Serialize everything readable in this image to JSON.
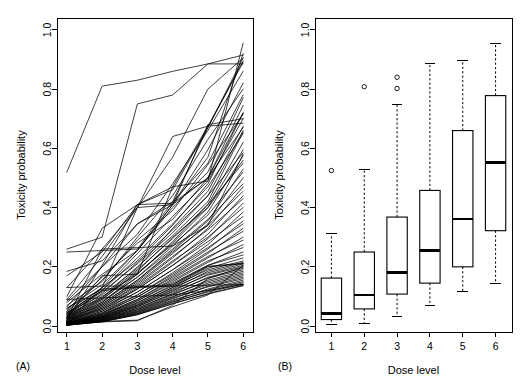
{
  "figure": {
    "background": "#ffffff",
    "ink": "#000000",
    "width": 524,
    "height": 388
  },
  "panels": [
    {
      "id": "A",
      "tag": "(A)",
      "type": "line",
      "title": "",
      "xlabel": "Dose level",
      "ylabel": "Toxicity probability",
      "xticks": [
        1,
        2,
        3,
        4,
        5,
        6
      ],
      "xticklabels": [
        "1",
        "2",
        "3",
        "4",
        "5",
        "6"
      ],
      "yticks": [
        0.0,
        0.2,
        0.4,
        0.6,
        0.8,
        1.0
      ],
      "yticklabels": [
        "0.0",
        "0.2",
        "0.4",
        "0.6",
        "0.8",
        "1.0"
      ],
      "xlim": [
        0.72,
        6.28
      ],
      "ylim": [
        -0.02,
        1.04
      ],
      "grid": false,
      "legend": false,
      "description": "Spaghetti plot of monotone increasing dose-toxicity curves; one polyline per simulated scenario across six dose levels."
    },
    {
      "id": "B",
      "tag": "(B)",
      "type": "boxplot",
      "title": "",
      "xlabel": "Dose level",
      "ylabel": "Toxicity probability",
      "xticks": [
        1,
        2,
        3,
        4,
        5,
        6
      ],
      "xticklabels": [
        "1",
        "2",
        "3",
        "4",
        "5",
        "6"
      ],
      "yticks": [
        0.0,
        0.2,
        0.4,
        0.6,
        0.8,
        1.0
      ],
      "yticklabels": [
        "0.0",
        "0.2",
        "0.4",
        "0.6",
        "0.8",
        "1.0"
      ],
      "xlim": [
        0.5,
        6.5
      ],
      "ylim": [
        -0.02,
        1.04
      ],
      "grid": false,
      "legend": false,
      "description": "Box-and-whisker summary of the toxicity probabilities at each dose level, with circular outlier markers."
    }
  ],
  "chart_data": [
    {
      "type": "line",
      "panel": "A",
      "title": "",
      "xlabel": "Dose level",
      "ylabel": "Toxicity probability",
      "x": [
        1,
        2,
        3,
        4,
        5,
        6
      ],
      "xlim": [
        0.72,
        6.28
      ],
      "ylim": [
        -0.02,
        1.04
      ],
      "grid": false,
      "legend_position": "none",
      "series": [
        {
          "name": "s01",
          "values": [
            0.52,
            0.81,
            0.83,
            0.86,
            0.885,
            0.885
          ]
        },
        {
          "name": "s02",
          "values": [
            0.26,
            0.3,
            0.75,
            0.78,
            0.885,
            0.915
          ]
        },
        {
          "name": "s03",
          "values": [
            0.25,
            0.255,
            0.26,
            0.42,
            0.67,
            0.905
          ]
        },
        {
          "name": "s04",
          "values": [
            0.185,
            0.22,
            0.345,
            0.41,
            0.57,
            0.92
          ]
        },
        {
          "name": "s05",
          "values": [
            0.17,
            0.25,
            0.41,
            0.47,
            0.49,
            0.955
          ]
        },
        {
          "name": "s06",
          "values": [
            0.13,
            0.26,
            0.4,
            0.57,
            0.8,
            0.905
          ]
        },
        {
          "name": "s07",
          "values": [
            0.1,
            0.33,
            0.41,
            0.46,
            0.67,
            0.895
          ]
        },
        {
          "name": "s08",
          "values": [
            0.09,
            0.235,
            0.4,
            0.64,
            0.675,
            0.89
          ]
        },
        {
          "name": "s09",
          "values": [
            0.085,
            0.2,
            0.31,
            0.48,
            0.66,
            0.86
          ]
        },
        {
          "name": "s10",
          "values": [
            0.08,
            0.175,
            0.255,
            0.41,
            0.595,
            0.82
          ]
        },
        {
          "name": "s11",
          "values": [
            0.07,
            0.15,
            0.3,
            0.44,
            0.63,
            0.8
          ]
        },
        {
          "name": "s12",
          "values": [
            0.065,
            0.2,
            0.345,
            0.42,
            0.55,
            0.78
          ]
        },
        {
          "name": "s13",
          "values": [
            0.06,
            0.14,
            0.255,
            0.4,
            0.52,
            0.77
          ]
        },
        {
          "name": "s14",
          "values": [
            0.055,
            0.165,
            0.28,
            0.36,
            0.5,
            0.745
          ]
        },
        {
          "name": "s15",
          "values": [
            0.05,
            0.13,
            0.22,
            0.34,
            0.48,
            0.72
          ]
        },
        {
          "name": "s16",
          "values": [
            0.05,
            0.155,
            0.29,
            0.39,
            0.545,
            0.715
          ]
        },
        {
          "name": "s17",
          "values": [
            0.045,
            0.12,
            0.245,
            0.37,
            0.49,
            0.7
          ]
        },
        {
          "name": "s18",
          "values": [
            0.045,
            0.105,
            0.195,
            0.33,
            0.455,
            0.675
          ]
        },
        {
          "name": "s19",
          "values": [
            0.04,
            0.13,
            0.255,
            0.41,
            0.5,
            0.67
          ]
        },
        {
          "name": "s20",
          "values": [
            0.04,
            0.115,
            0.21,
            0.315,
            0.44,
            0.66
          ]
        },
        {
          "name": "s21",
          "values": [
            0.04,
            0.095,
            0.2,
            0.305,
            0.42,
            0.655
          ]
        },
        {
          "name": "s22",
          "values": [
            0.035,
            0.12,
            0.23,
            0.345,
            0.47,
            0.65
          ]
        },
        {
          "name": "s23",
          "values": [
            0.035,
            0.1,
            0.175,
            0.285,
            0.41,
            0.62
          ]
        },
        {
          "name": "s24",
          "values": [
            0.035,
            0.09,
            0.185,
            0.3,
            0.4,
            0.595
          ]
        },
        {
          "name": "s25",
          "values": [
            0.03,
            0.11,
            0.215,
            0.325,
            0.44,
            0.585
          ]
        },
        {
          "name": "s26",
          "values": [
            0.03,
            0.085,
            0.165,
            0.27,
            0.385,
            0.575
          ]
        },
        {
          "name": "s27",
          "values": [
            0.03,
            0.08,
            0.175,
            0.28,
            0.4,
            0.56
          ]
        },
        {
          "name": "s28",
          "values": [
            0.03,
            0.095,
            0.19,
            0.295,
            0.41,
            0.55
          ]
        },
        {
          "name": "s29",
          "values": [
            0.025,
            0.075,
            0.155,
            0.255,
            0.355,
            0.53
          ]
        },
        {
          "name": "s30",
          "values": [
            0.025,
            0.09,
            0.18,
            0.275,
            0.375,
            0.52
          ]
        },
        {
          "name": "s31",
          "values": [
            0.025,
            0.07,
            0.15,
            0.245,
            0.345,
            0.5
          ]
        },
        {
          "name": "s32",
          "values": [
            0.025,
            0.08,
            0.165,
            0.26,
            0.36,
            0.48
          ]
        },
        {
          "name": "s33",
          "values": [
            0.02,
            0.065,
            0.14,
            0.23,
            0.33,
            0.47
          ]
        },
        {
          "name": "s34",
          "values": [
            0.02,
            0.075,
            0.155,
            0.25,
            0.34,
            0.455
          ]
        },
        {
          "name": "s35",
          "values": [
            0.02,
            0.06,
            0.13,
            0.215,
            0.31,
            0.44
          ]
        },
        {
          "name": "s36",
          "values": [
            0.02,
            0.07,
            0.145,
            0.235,
            0.325,
            0.43
          ]
        },
        {
          "name": "s37",
          "values": [
            0.02,
            0.055,
            0.125,
            0.205,
            0.295,
            0.415
          ]
        },
        {
          "name": "s38",
          "values": [
            0.015,
            0.065,
            0.135,
            0.22,
            0.3,
            0.4
          ]
        },
        {
          "name": "s39",
          "values": [
            0.015,
            0.05,
            0.115,
            0.19,
            0.275,
            0.385
          ]
        },
        {
          "name": "s40",
          "values": [
            0.015,
            0.06,
            0.125,
            0.205,
            0.285,
            0.37
          ]
        },
        {
          "name": "s41",
          "values": [
            0.015,
            0.045,
            0.105,
            0.18,
            0.26,
            0.355
          ]
        },
        {
          "name": "s42",
          "values": [
            0.015,
            0.055,
            0.115,
            0.19,
            0.265,
            0.345
          ]
        },
        {
          "name": "s43",
          "values": [
            0.012,
            0.042,
            0.098,
            0.17,
            0.245,
            0.33
          ]
        },
        {
          "name": "s44",
          "values": [
            0.012,
            0.05,
            0.105,
            0.175,
            0.25,
            0.32
          ]
        },
        {
          "name": "s45",
          "values": [
            0.012,
            0.038,
            0.09,
            0.16,
            0.23,
            0.3
          ]
        },
        {
          "name": "s46",
          "values": [
            0.01,
            0.045,
            0.098,
            0.165,
            0.235,
            0.29
          ]
        },
        {
          "name": "s47",
          "values": [
            0.01,
            0.035,
            0.085,
            0.15,
            0.215,
            0.275
          ]
        },
        {
          "name": "s48",
          "values": [
            0.01,
            0.04,
            0.09,
            0.155,
            0.22,
            0.265
          ]
        },
        {
          "name": "s49",
          "values": [
            0.01,
            0.032,
            0.078,
            0.14,
            0.205,
            0.25
          ]
        },
        {
          "name": "s50",
          "values": [
            0.01,
            0.038,
            0.085,
            0.145,
            0.205,
            0.24
          ]
        },
        {
          "name": "s51",
          "values": [
            0.008,
            0.03,
            0.072,
            0.13,
            0.195,
            0.23
          ]
        },
        {
          "name": "s52",
          "values": [
            0.008,
            0.035,
            0.08,
            0.135,
            0.19,
            0.22
          ]
        },
        {
          "name": "s53",
          "values": [
            0.008,
            0.028,
            0.068,
            0.125,
            0.185,
            0.215
          ]
        },
        {
          "name": "s54",
          "values": [
            0.008,
            0.032,
            0.075,
            0.13,
            0.18,
            0.21
          ]
        },
        {
          "name": "s55",
          "values": [
            0.006,
            0.026,
            0.065,
            0.118,
            0.175,
            0.205
          ]
        },
        {
          "name": "s56",
          "values": [
            0.006,
            0.03,
            0.07,
            0.122,
            0.172,
            0.2
          ]
        },
        {
          "name": "s57",
          "values": [
            0.006,
            0.024,
            0.06,
            0.11,
            0.165,
            0.195
          ]
        },
        {
          "name": "s58",
          "values": [
            0.006,
            0.028,
            0.065,
            0.115,
            0.162,
            0.19
          ]
        },
        {
          "name": "s59",
          "values": [
            0.005,
            0.022,
            0.056,
            0.105,
            0.155,
            0.185
          ]
        },
        {
          "name": "s60",
          "values": [
            0.005,
            0.025,
            0.06,
            0.108,
            0.15,
            0.18
          ]
        },
        {
          "name": "s61",
          "values": [
            0.005,
            0.02,
            0.052,
            0.098,
            0.145,
            0.175
          ]
        },
        {
          "name": "s62",
          "values": [
            0.005,
            0.023,
            0.055,
            0.1,
            0.14,
            0.17
          ]
        },
        {
          "name": "s63",
          "values": [
            0.004,
            0.018,
            0.048,
            0.092,
            0.135,
            0.165
          ]
        },
        {
          "name": "s64",
          "values": [
            0.004,
            0.021,
            0.05,
            0.095,
            0.132,
            0.16
          ]
        },
        {
          "name": "s65",
          "values": [
            0.004,
            0.016,
            0.044,
            0.085,
            0.125,
            0.155
          ]
        },
        {
          "name": "s66",
          "values": [
            0.004,
            0.019,
            0.046,
            0.088,
            0.122,
            0.15
          ]
        },
        {
          "name": "s67",
          "values": [
            0.003,
            0.015,
            0.04,
            0.08,
            0.118,
            0.146
          ]
        },
        {
          "name": "s68",
          "values": [
            0.003,
            0.017,
            0.042,
            0.082,
            0.115,
            0.142
          ]
        },
        {
          "name": "s69",
          "values": [
            0.003,
            0.014,
            0.038,
            0.075,
            0.11,
            0.138
          ]
        },
        {
          "name": "s70",
          "values": [
            0.003,
            0.015,
            0.039,
            0.076,
            0.108,
            0.136
          ]
        },
        {
          "name": "s71",
          "values": [
            0.09,
            0.095,
            0.1,
            0.105,
            0.12,
            0.14
          ]
        },
        {
          "name": "s72",
          "values": [
            0.13,
            0.135,
            0.135,
            0.135,
            0.138,
            0.14
          ]
        },
        {
          "name": "s73",
          "values": [
            0.012,
            0.016,
            0.02,
            0.065,
            0.105,
            0.205
          ]
        },
        {
          "name": "s74",
          "values": [
            0.01,
            0.014,
            0.018,
            0.07,
            0.16,
            0.2
          ]
        },
        {
          "name": "s75",
          "values": [
            0.045,
            0.12,
            0.13,
            0.135,
            0.2,
            0.21
          ]
        },
        {
          "name": "s76",
          "values": [
            0.06,
            0.125,
            0.132,
            0.14,
            0.202,
            0.212
          ]
        },
        {
          "name": "s77",
          "values": [
            0.025,
            0.26,
            0.265,
            0.27,
            0.34,
            0.58
          ]
        },
        {
          "name": "s78",
          "values": [
            0.02,
            0.205,
            0.41,
            0.415,
            0.5,
            0.72
          ]
        },
        {
          "name": "s79",
          "values": [
            0.015,
            0.13,
            0.4,
            0.41,
            0.68,
            0.7
          ]
        },
        {
          "name": "s80",
          "values": [
            0.03,
            0.17,
            0.175,
            0.47,
            0.675,
            0.685
          ]
        }
      ]
    },
    {
      "type": "boxplot",
      "panel": "B",
      "title": "",
      "xlabel": "Dose level",
      "ylabel": "Toxicity probability",
      "categories": [
        "1",
        "2",
        "3",
        "4",
        "5",
        "6"
      ],
      "xlim": [
        0.5,
        6.5
      ],
      "ylim": [
        -0.02,
        1.04
      ],
      "grid": false,
      "legend_position": "none",
      "boxes": [
        {
          "category": "1",
          "lower_whisker": 0.005,
          "q1": 0.022,
          "median": 0.042,
          "q3": 0.162,
          "upper_whisker": 0.312,
          "outliers": [
            0.525
          ]
        },
        {
          "category": "2",
          "lower_whisker": 0.008,
          "q1": 0.058,
          "median": 0.105,
          "q3": 0.25,
          "upper_whisker": 0.528,
          "outliers": [
            0.808
          ]
        },
        {
          "category": "3",
          "lower_whisker": 0.033,
          "q1": 0.108,
          "median": 0.18,
          "q3": 0.368,
          "upper_whisker": 0.748,
          "outliers": [
            0.84,
            0.802
          ]
        },
        {
          "category": "4",
          "lower_whisker": 0.07,
          "q1": 0.145,
          "median": 0.255,
          "q3": 0.458,
          "upper_whisker": 0.885,
          "outliers": []
        },
        {
          "category": "5",
          "lower_whisker": 0.118,
          "q1": 0.2,
          "median": 0.362,
          "q3": 0.66,
          "upper_whisker": 0.898,
          "outliers": []
        },
        {
          "category": "6",
          "lower_whisker": 0.145,
          "q1": 0.322,
          "median": 0.552,
          "q3": 0.778,
          "upper_whisker": 0.955,
          "outliers": []
        }
      ]
    }
  ]
}
